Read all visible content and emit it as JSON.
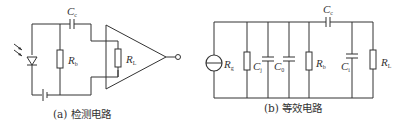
{
  "figure_a": {
    "caption": "(a)  检测电路",
    "labels": {
      "coupling_capacitor": {
        "main": "C",
        "sub": "c"
      },
      "bias_resistor": {
        "main": "R",
        "sub": "b"
      },
      "load_resistor": {
        "main": "R",
        "sub": "L"
      }
    },
    "components": [
      "photodiode",
      "battery",
      "bias-resistor",
      "coupling-capacitor",
      "load-resistor",
      "amplifier",
      "output-terminal"
    ]
  },
  "figure_b": {
    "caption": "(b)  等效电路",
    "labels": {
      "source_resistance": {
        "main": "R",
        "sub": "g"
      },
      "junction_capacitance": {
        "main": "C",
        "sub": "j"
      },
      "distributed_capacitance": {
        "main": "C",
        "sub": "0"
      },
      "bias_resistor": {
        "main": "R",
        "sub": "b"
      },
      "coupling_capacitor": {
        "main": "C",
        "sub": "c"
      },
      "input_capacitance": {
        "main": "C",
        "sub": "i"
      },
      "load_resistor": {
        "main": "R",
        "sub": "L"
      }
    },
    "components": [
      "current-source",
      "Rg",
      "Cj",
      "C0",
      "Rb",
      "Cc",
      "Ci",
      "RL"
    ]
  }
}
